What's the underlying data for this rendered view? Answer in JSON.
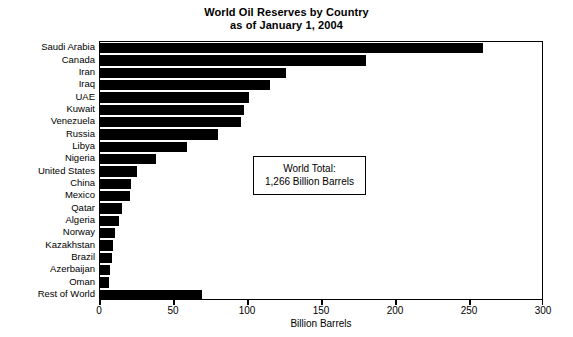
{
  "chart_data": {
    "type": "bar",
    "orientation": "horizontal",
    "title": "World Oil Reserves by Country as of January 1, 2004",
    "title_lines": [
      "World Oil Reserves by Country",
      "as of January 1, 2004"
    ],
    "xlabel": "Billion Barrels",
    "ylabel": "",
    "xlim": [
      0,
      300
    ],
    "xticks": [
      0,
      50,
      100,
      150,
      200,
      250,
      300
    ],
    "xticklabels": [
      "0",
      "50",
      "100",
      "150",
      "200",
      "250",
      "300"
    ],
    "grid": false,
    "legend": false,
    "bar_color": "#000000",
    "categories": [
      "Saudi Arabia",
      "Canada",
      "Iran",
      "Iraq",
      "UAE",
      "Kuwait",
      "Venezuela",
      "Russia",
      "Libya",
      "Nigeria",
      "United States",
      "China",
      "Mexico",
      "Qatar",
      "Algeria",
      "Norway",
      "Kazakhstan",
      "Brazil",
      "Azerbaijan",
      "Oman",
      "Rest of World"
    ],
    "values": [
      259,
      180,
      126,
      115,
      101,
      97,
      95,
      80,
      59,
      38,
      25,
      21,
      20,
      15,
      13,
      10,
      9,
      8,
      7,
      6,
      69
    ],
    "annotations": [
      {
        "name": "world-total",
        "lines": [
          "World Total:",
          "1,266 Billion Barrels"
        ]
      }
    ]
  }
}
